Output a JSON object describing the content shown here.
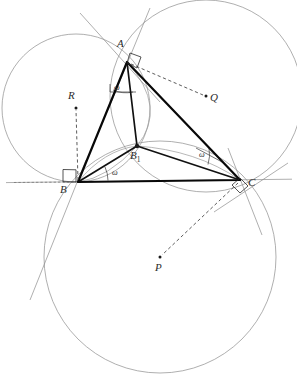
{
  "figure": {
    "type": "geometry-diagram",
    "background": "#ffffff",
    "stroke_dark": "#1a1a1a",
    "stroke_light": "#8a8a8a",
    "stroke_mid": "#555555",
    "width": 297,
    "height": 389
  },
  "points": {
    "A": {
      "label": "A",
      "x": 127,
      "y": 62,
      "label_x": 117,
      "label_y": 42
    },
    "B": {
      "label": "B",
      "x": 78,
      "y": 182,
      "label_x": 61,
      "label_y": 185
    },
    "C": {
      "label": "C",
      "x": 240,
      "y": 180,
      "label_x": 248,
      "label_y": 180
    },
    "B1": {
      "label": "B",
      "sub": "1",
      "x": 137,
      "y": 146,
      "label_x": 131,
      "label_y": 152
    },
    "P": {
      "label": "P",
      "x": 160,
      "y": 257,
      "label_x": 155,
      "label_y": 263
    },
    "Q": {
      "label": "Q",
      "x": 206,
      "y": 96,
      "label_x": 210,
      "label_y": 94
    },
    "R": {
      "label": "R",
      "x": 76,
      "y": 108,
      "label_x": 68,
      "label_y": 92
    }
  },
  "angle_labels": [
    {
      "name": "omega-at-A",
      "text": "ω",
      "x": 118,
      "y": 85
    },
    {
      "name": "omega-at-B",
      "text": "ω",
      "x": 113,
      "y": 170
    },
    {
      "name": "omega-at-C",
      "text": "ω",
      "x": 200,
      "y": 152
    }
  ],
  "circles": [
    {
      "name": "circle-R-through-A-B",
      "cx": 76,
      "cy": 108,
      "r": 74,
      "center_point": "R"
    },
    {
      "name": "circle-Q-through-A-C",
      "cx": 206,
      "cy": 96,
      "r": 96,
      "center_point": "Q"
    },
    {
      "name": "circle-P-through-B-C",
      "cx": 160,
      "cy": 257,
      "r": 116,
      "center_point": "P"
    }
  ],
  "triangle": {
    "name": "triangle-ABC",
    "vertices": [
      "A",
      "B",
      "C"
    ]
  },
  "cevians": [
    {
      "name": "cevian-A-B1",
      "from": "A",
      "to": "B1"
    },
    {
      "name": "cevian-B-B1",
      "from": "B",
      "to": "B1"
    },
    {
      "name": "cevian-C-B1",
      "from": "C",
      "to": "B1"
    }
  ],
  "radii_dashed": [
    {
      "name": "radius-A-Q",
      "from": "A",
      "to": "Q"
    },
    {
      "name": "radius-B-R",
      "from": "B",
      "to": "R"
    },
    {
      "name": "radius-C-P",
      "from": "C",
      "to": "P"
    }
  ],
  "right_angle_marks": [
    {
      "name": "right-angle-at-A",
      "x": 127,
      "y": 62
    },
    {
      "name": "right-angle-at-B",
      "x": 78,
      "y": 182
    },
    {
      "name": "right-angle-at-C",
      "x": 240,
      "y": 180
    }
  ]
}
